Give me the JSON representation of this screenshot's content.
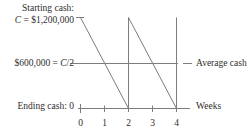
{
  "figure": {
    "title_text": "",
    "axis_color": "#7d7d7d",
    "text_color": "#2e2e2e",
    "background": "#ffffff"
  },
  "labels": {
    "starting_cash_line1": "Starting cash:",
    "starting_cash_symbol": "C",
    "starting_cash_line2_rest": " = $1,200,000",
    "average_cash_value": "$600,000 = ",
    "average_cash_symbol": "C",
    "average_cash_divisor": "/2",
    "ending_cash": "Ending cash: 0",
    "average_cash_right": "Average cash",
    "weeks_right": "Weeks"
  },
  "chart_data": {
    "type": "line",
    "title": "",
    "xlabel": "Weeks",
    "ylabel": "",
    "xlim": [
      0,
      4.6
    ],
    "ylim": [
      0,
      1200000
    ],
    "grid": false,
    "legend": null,
    "x_ticks": [
      0,
      1,
      2,
      3,
      4
    ],
    "x_tick_labels": [
      "0",
      "1",
      "2",
      "3",
      "4"
    ],
    "y_reference_lines": [
      {
        "name": "starting-cash",
        "value": 1200000,
        "label": "C = $1,200,000",
        "drawn": "tick-only"
      },
      {
        "name": "average-cash",
        "value": 600000,
        "label": "$600,000 = C/2",
        "drawn": "full-horizontal"
      },
      {
        "name": "ending-cash",
        "value": 0,
        "label": "Ending cash: 0",
        "drawn": "axis"
      }
    ],
    "series": [
      {
        "name": "cash-balance-sawtooth",
        "x": [
          0,
          2,
          2,
          4,
          4
        ],
        "values": [
          1200000,
          0,
          1200000,
          0,
          1200000
        ],
        "description": "Cash declines linearly from C to 0 over two weeks, then is replenished to C."
      }
    ]
  },
  "tick_numbers": [
    {
      "label": "0",
      "x": 0
    },
    {
      "label": "1",
      "x": 1
    },
    {
      "label": "2",
      "x": 2
    },
    {
      "label": "3",
      "x": 3
    },
    {
      "label": "4",
      "x": 4
    }
  ]
}
